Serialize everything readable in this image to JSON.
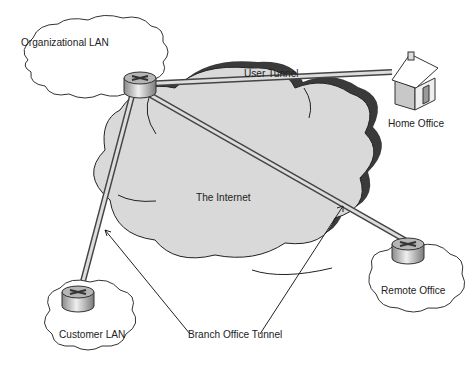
{
  "diagram": {
    "type": "network-topology",
    "nodes": [
      {
        "id": "org-lan",
        "label": "Organizational LAN",
        "shape": "cloud",
        "device": "router"
      },
      {
        "id": "home-office",
        "label": "Home Office",
        "shape": "house"
      },
      {
        "id": "internet",
        "label": "The Internet",
        "shape": "cloud"
      },
      {
        "id": "customer-lan",
        "label": "Customer LAN",
        "shape": "cloud",
        "device": "router"
      },
      {
        "id": "remote-office",
        "label": "Remote Office",
        "shape": "cloud",
        "device": "router"
      }
    ],
    "edges": [
      {
        "from": "org-lan",
        "to": "home-office",
        "label": "User Tunnel"
      },
      {
        "from": "org-lan",
        "to": "customer-lan",
        "label": "Branch Office Tunnel"
      },
      {
        "from": "org-lan",
        "to": "remote-office",
        "label": "Branch Office Tunnel"
      }
    ],
    "labels": {
      "org_lan": "Organizational LAN",
      "user_tunnel": "User Tunnel",
      "home_office": "Home Office",
      "internet": "The Internet",
      "customer_lan": "Customer LAN",
      "remote_office": "Remote Office",
      "branch_tunnel": "Branch Office Tunnel"
    },
    "colors": {
      "internet_fill": "#d9d9d9",
      "internet_shadow": "#3a3a3a",
      "pipe": "#9a9a9a",
      "router": "#b5b5b5"
    }
  }
}
